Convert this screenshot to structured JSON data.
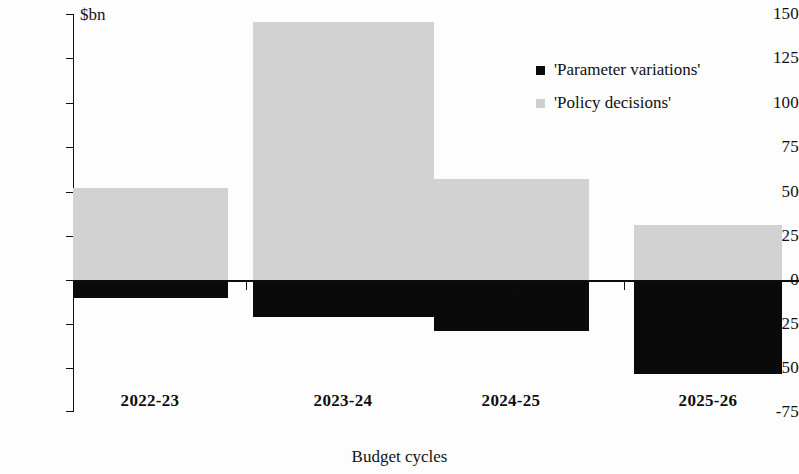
{
  "chart_data": {
    "type": "bar",
    "title": "",
    "subtitle": "",
    "xlabel": "Budget cycles",
    "ylabel": "$bn",
    "categories": [
      "2022-23",
      "2023-24",
      "2024-25",
      "2025-26"
    ],
    "series": [
      {
        "name": "'Policy decisions'",
        "color": "#d2d2d2",
        "values": [
          52,
          146,
          57,
          31
        ]
      },
      {
        "name": "'Parameter variations'",
        "color": "#0a0a0a",
        "values": [
          -10,
          -21,
          -29,
          -53
        ]
      }
    ],
    "ylim": [
      -75,
      150
    ],
    "yticks": [
      150,
      125,
      100,
      75,
      50,
      25,
      0,
      -25,
      -50,
      -75
    ],
    "ytick_labels": [
      "150",
      "125",
      "100",
      "75",
      "50",
      "25",
      "0",
      "-25",
      "-50",
      "-75"
    ],
    "grid": false,
    "stacked": "diverging-zero-baseline",
    "legend_position": "upper-right",
    "legend": [
      {
        "label": "'Parameter variations'",
        "swatch": "dark"
      },
      {
        "label": "'Policy decisions'",
        "swatch": "light"
      }
    ]
  },
  "axis": {
    "unit_label": "$bn",
    "x_axis_title": "Budget cycles"
  }
}
